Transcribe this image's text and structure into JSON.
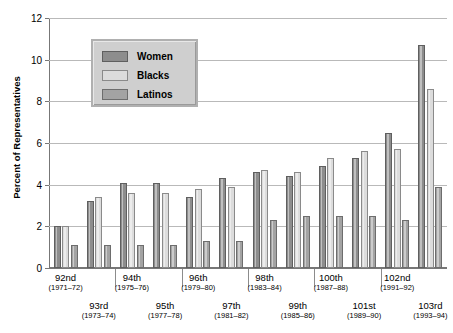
{
  "chart_data": {
    "type": "bar",
    "title": "",
    "xlabel": "",
    "ylabel": "Percent of Representatives",
    "ylim": [
      0,
      12
    ],
    "yticks": [
      0,
      2,
      4,
      6,
      8,
      10,
      12
    ],
    "grid": true,
    "legend_position": "upper-left-inset",
    "categories": [
      "92nd",
      "93rd",
      "94th",
      "95th",
      "96th",
      "97th",
      "98th",
      "99th",
      "100th",
      "101st",
      "102nd",
      "103rd"
    ],
    "category_years": [
      "(1971–72)",
      "(1973–74)",
      "(1975–76)",
      "(1977–78)",
      "(1979–80)",
      "(1981–82)",
      "(1983–84)",
      "(1985–86)",
      "(1987–88)",
      "(1989–90)",
      "(1991–92)",
      "(1993–94)"
    ],
    "series": [
      {
        "name": "Women",
        "color": "#8d8d8d",
        "values": [
          2.0,
          3.2,
          4.1,
          4.1,
          3.4,
          4.3,
          4.6,
          4.4,
          4.9,
          5.3,
          6.5,
          10.7
        ]
      },
      {
        "name": "Blacks",
        "color": "#dcdcdc",
        "values": [
          2.0,
          3.4,
          3.6,
          3.6,
          3.8,
          3.9,
          4.7,
          4.6,
          5.3,
          5.6,
          5.7,
          8.6
        ]
      },
      {
        "name": "Latinos",
        "color": "#a3a3a3",
        "values": [
          1.1,
          1.1,
          1.1,
          1.1,
          1.3,
          1.3,
          2.3,
          2.5,
          2.5,
          2.5,
          2.3,
          3.9
        ]
      }
    ]
  },
  "legend": {
    "items": [
      {
        "label": "Women",
        "swatch": "women"
      },
      {
        "label": "Blacks",
        "swatch": "blacks"
      },
      {
        "label": "Latinos",
        "swatch": "latinos"
      }
    ]
  }
}
